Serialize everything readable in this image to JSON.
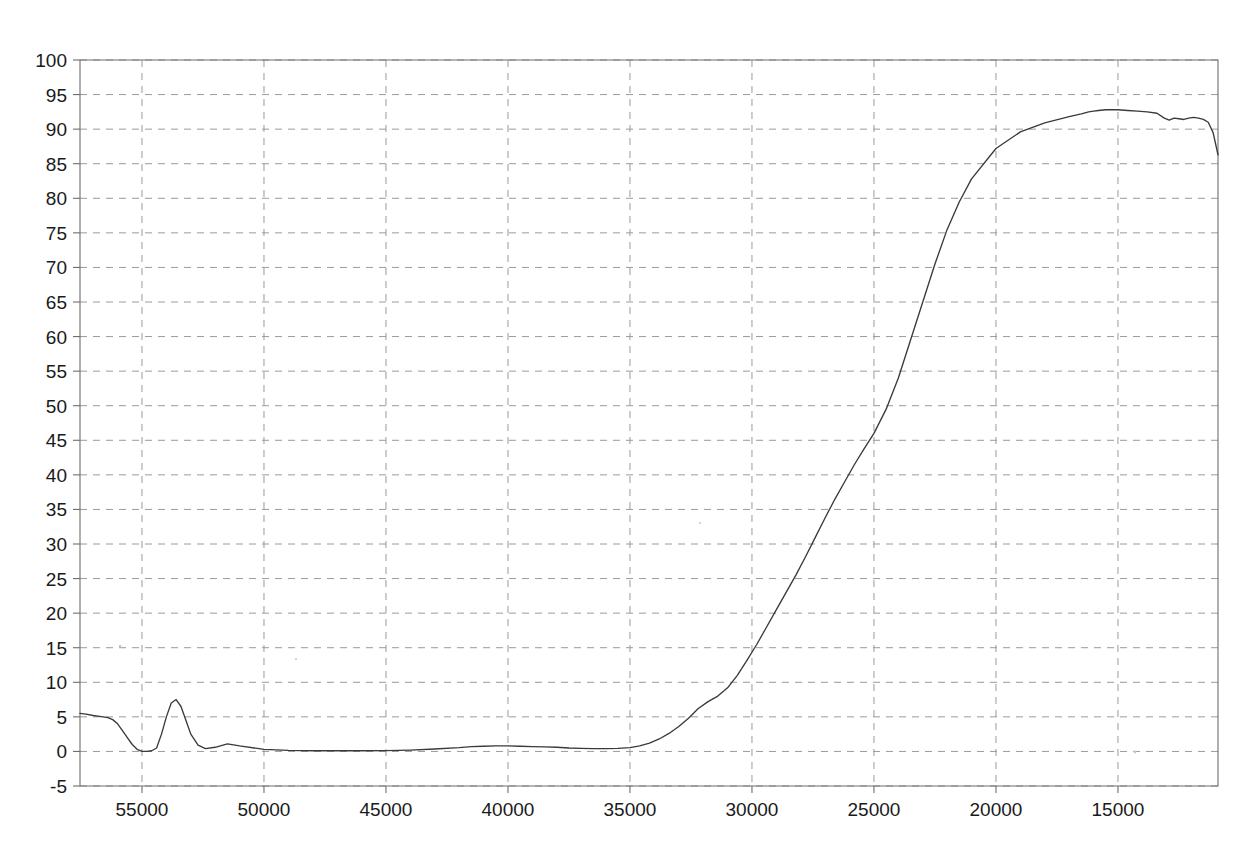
{
  "chart_data": {
    "type": "line",
    "title": "",
    "subtitle": "",
    "xlabel": "",
    "ylabel": "",
    "xlim": [
      57540,
      10900
    ],
    "ylim": [
      -5,
      100
    ],
    "x_axis_reversed": true,
    "grid": true,
    "legend": null,
    "xticks": [
      55000,
      50000,
      45000,
      40000,
      35000,
      30000,
      25000,
      20000,
      15000
    ],
    "xtick_labels": [
      "55000",
      "50000",
      "45000",
      "40000",
      "35000",
      "30000",
      "25000",
      "20000",
      "15000"
    ],
    "yticks": [
      100,
      95,
      90,
      85,
      80,
      75,
      70,
      65,
      60,
      55,
      50,
      45,
      40,
      35,
      30,
      25,
      20,
      15,
      10,
      5,
      0,
      -5
    ],
    "ytick_labels": [
      "100",
      "95",
      "90",
      "85",
      "80",
      "75",
      "70",
      "65",
      "60",
      "55",
      "50",
      "45",
      "40",
      "35",
      "30",
      "25",
      "20",
      "15",
      "10",
      "5",
      "0",
      "-5"
    ],
    "series": [
      {
        "name": "transmittance",
        "color": "#3a3a3a",
        "x": [
          57540,
          57300,
          57000,
          56800,
          56600,
          56400,
          56200,
          56000,
          55800,
          55600,
          55400,
          55200,
          55000,
          54800,
          54600,
          54400,
          54200,
          54000,
          53800,
          53600,
          53400,
          53200,
          53000,
          52700,
          52400,
          52000,
          51500,
          51000,
          50000,
          49000,
          48000,
          47000,
          46000,
          45000,
          44000,
          43000,
          42000,
          41500,
          41000,
          40500,
          40000,
          39500,
          39000,
          38500,
          38000,
          37500,
          37000,
          36500,
          36000,
          35500,
          35000,
          34600,
          34200,
          33800,
          33400,
          33000,
          32600,
          32200,
          31800,
          31400,
          31000,
          30600,
          30200,
          29800,
          29400,
          29000,
          28600,
          28200,
          27800,
          27400,
          27000,
          26600,
          26200,
          25800,
          25400,
          25000,
          24500,
          24000,
          23500,
          23000,
          22500,
          22000,
          21500,
          21000,
          20000,
          19000,
          18000,
          17000,
          16500,
          16200,
          16000,
          15800,
          15500,
          15200,
          15000,
          14600,
          14200,
          13800,
          13400,
          13100,
          12900,
          12700,
          12500,
          12300,
          12100,
          11900,
          11700,
          11500,
          11300,
          11100,
          10900
        ],
        "y": [
          5.5,
          5.4,
          5.2,
          5.1,
          5.0,
          4.9,
          4.6,
          4.0,
          3.0,
          2.0,
          1.0,
          0.3,
          0.0,
          0.0,
          0.1,
          0.5,
          2.5,
          5.0,
          7.0,
          7.5,
          6.5,
          4.5,
          2.5,
          0.9,
          0.4,
          0.6,
          1.1,
          0.8,
          0.3,
          0.15,
          0.1,
          0.1,
          0.1,
          0.12,
          0.2,
          0.35,
          0.55,
          0.7,
          0.75,
          0.8,
          0.8,
          0.75,
          0.7,
          0.65,
          0.6,
          0.5,
          0.45,
          0.4,
          0.4,
          0.45,
          0.55,
          0.8,
          1.2,
          1.8,
          2.6,
          3.6,
          4.8,
          6.2,
          7.2,
          8.0,
          9.2,
          11.0,
          13.2,
          15.5,
          18.0,
          20.5,
          23.0,
          25.5,
          28.2,
          31.0,
          33.8,
          36.5,
          39.0,
          41.5,
          43.8,
          46.0,
          49.5,
          54.0,
          59.5,
          65.0,
          70.5,
          75.5,
          79.5,
          82.8,
          87.2,
          89.6,
          90.9,
          91.8,
          92.2,
          92.5,
          92.6,
          92.7,
          92.8,
          92.8,
          92.8,
          92.7,
          92.6,
          92.5,
          92.3,
          91.6,
          91.3,
          91.6,
          91.5,
          91.4,
          91.6,
          91.7,
          91.6,
          91.4,
          91.0,
          89.5,
          86.3
        ]
      }
    ],
    "annotations": []
  },
  "figure": {
    "background_color": "#ffffff",
    "axis_color": "#6e6e6e",
    "grid_color": "#9a9a9a",
    "curve_color": "#3a3a3a",
    "tick_label_color": "#1a1a1a"
  }
}
